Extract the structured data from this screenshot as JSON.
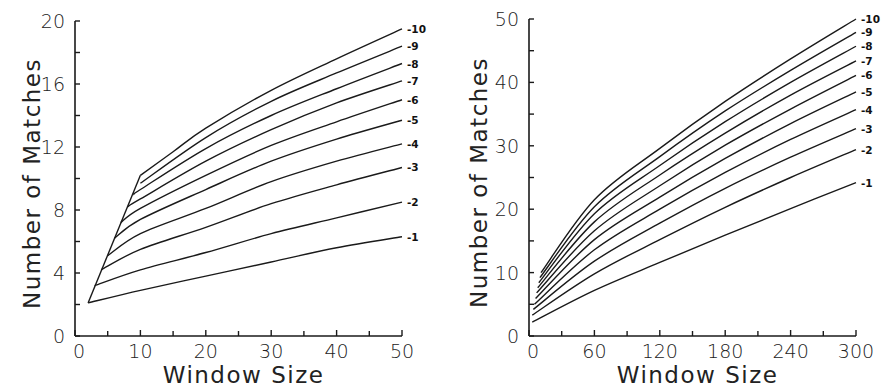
{
  "chart_data": [
    {
      "type": "line",
      "title": "",
      "xlabel": "Window Size",
      "ylabel": "Number of Matches",
      "xlim": [
        0,
        50
      ],
      "ylim": [
        0,
        20
      ],
      "xticks": [
        0,
        10,
        20,
        30,
        40,
        50
      ],
      "xtick_labels": [
        "0",
        "10",
        "20",
        "30",
        "40",
        "50"
      ],
      "xminor": [
        5,
        15,
        25,
        35,
        45
      ],
      "yticks": [
        0,
        4,
        8,
        12,
        16,
        20
      ],
      "ytick_labels": [
        "0",
        "4",
        "8",
        "12",
        "16",
        "20"
      ],
      "yminor": [
        2,
        6,
        10,
        14,
        18
      ],
      "grid": false,
      "legend": "inline-right-end-labels",
      "series": [
        {
          "name": "-1",
          "x": [
            2,
            10,
            20,
            30,
            40,
            50
          ],
          "y": [
            2.1,
            2.9,
            3.8,
            4.7,
            5.6,
            6.3
          ]
        },
        {
          "name": "-2",
          "x": [
            3,
            10,
            20,
            30,
            40,
            50
          ],
          "y": [
            3.2,
            4.2,
            5.3,
            6.5,
            7.5,
            8.5
          ]
        },
        {
          "name": "-3",
          "x": [
            4,
            10,
            20,
            30,
            40,
            50
          ],
          "y": [
            4.2,
            5.5,
            6.9,
            8.4,
            9.6,
            10.7
          ]
        },
        {
          "name": "-4",
          "x": [
            5,
            10,
            20,
            30,
            40,
            50
          ],
          "y": [
            5.1,
            6.5,
            8.1,
            9.8,
            11.1,
            12.2
          ]
        },
        {
          "name": "-5",
          "x": [
            6,
            10,
            20,
            30,
            40,
            50
          ],
          "y": [
            6.2,
            7.4,
            9.3,
            11.1,
            12.5,
            13.7
          ]
        },
        {
          "name": "-6",
          "x": [
            7,
            10,
            20,
            30,
            40,
            50
          ],
          "y": [
            7.2,
            8.1,
            10.2,
            12.1,
            13.6,
            15.0
          ]
        },
        {
          "name": "-7",
          "x": [
            8,
            10,
            20,
            30,
            40,
            50
          ],
          "y": [
            8.2,
            8.7,
            11.1,
            13.1,
            14.8,
            16.2
          ]
        },
        {
          "name": "-8",
          "x": [
            9,
            10,
            20,
            30,
            40,
            50
          ],
          "y": [
            9.0,
            9.3,
            11.9,
            14.0,
            15.7,
            17.3
          ]
        },
        {
          "name": "-9",
          "x": [
            10,
            20,
            30,
            40,
            50
          ],
          "y": [
            9.7,
            12.6,
            14.9,
            16.7,
            18.4
          ]
        },
        {
          "name": "-10",
          "x": [
            10,
            15,
            20,
            30,
            40,
            50
          ],
          "y": [
            10.2,
            11.7,
            13.2,
            15.6,
            17.6,
            19.5
          ]
        }
      ],
      "envelope": {
        "x": [
          2,
          10
        ],
        "y": [
          2.1,
          10.2
        ]
      }
    },
    {
      "type": "line",
      "title": "",
      "xlabel": "Window Size",
      "ylabel": "Number of Matches",
      "xlim": [
        0,
        300
      ],
      "ylim": [
        0,
        50
      ],
      "xticks": [
        0,
        60,
        120,
        180,
        240,
        300
      ],
      "xtick_labels": [
        "0",
        "60",
        "120",
        "180",
        "240",
        "300"
      ],
      "xminor": [
        30,
        90,
        150,
        210,
        270
      ],
      "yticks": [
        0,
        10,
        20,
        30,
        40,
        50
      ],
      "ytick_labels": [
        "0",
        "10",
        "20",
        "30",
        "40",
        "50"
      ],
      "yminor": [
        5,
        15,
        25,
        35,
        45
      ],
      "grid": false,
      "legend": "inline-right-end-labels",
      "series": [
        {
          "name": "-1",
          "x": [
            3,
            60,
            120,
            180,
            240,
            300
          ],
          "y": [
            2.2,
            7.2,
            11.6,
            15.9,
            20.1,
            24.2
          ]
        },
        {
          "name": "-2",
          "x": [
            3,
            60,
            120,
            180,
            240,
            300
          ],
          "y": [
            3.3,
            9.8,
            15.2,
            20.3,
            25.0,
            29.4
          ]
        },
        {
          "name": "-3",
          "x": [
            4,
            60,
            120,
            180,
            240,
            300
          ],
          "y": [
            4.2,
            11.8,
            17.8,
            23.3,
            28.2,
            32.7
          ]
        },
        {
          "name": "-4",
          "x": [
            5,
            60,
            120,
            180,
            240,
            300
          ],
          "y": [
            5.0,
            13.6,
            20.0,
            25.8,
            31.0,
            35.7
          ]
        },
        {
          "name": "-5",
          "x": [
            6,
            60,
            120,
            180,
            240,
            300
          ],
          "y": [
            5.9,
            15.2,
            21.9,
            28.0,
            33.5,
            38.5
          ]
        },
        {
          "name": "-6",
          "x": [
            7,
            60,
            120,
            180,
            240,
            300
          ],
          "y": [
            6.8,
            16.6,
            23.7,
            30.1,
            35.8,
            41.1
          ]
        },
        {
          "name": "-7",
          "x": [
            8,
            60,
            120,
            180,
            240,
            300
          ],
          "y": [
            7.6,
            18.0,
            25.4,
            32.0,
            38.0,
            43.4
          ]
        },
        {
          "name": "-8",
          "x": [
            9,
            60,
            120,
            180,
            240,
            300
          ],
          "y": [
            8.4,
            19.3,
            26.9,
            33.8,
            40.0,
            45.7
          ]
        },
        {
          "name": "-9",
          "x": [
            10,
            60,
            120,
            180,
            240,
            300
          ],
          "y": [
            9.2,
            20.4,
            28.3,
            35.5,
            41.9,
            47.9
          ]
        },
        {
          "name": "-10",
          "x": [
            11,
            60,
            120,
            180,
            240,
            300
          ],
          "y": [
            10.0,
            21.5,
            29.6,
            37.0,
            43.7,
            50.0
          ]
        }
      ]
    }
  ]
}
